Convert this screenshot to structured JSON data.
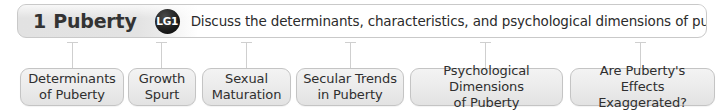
{
  "header": {
    "chapter_number": "1",
    "chapter_title": "Puberty",
    "badge_label": "LG1",
    "learning_goal": "Discuss the determinants, characteristics, and psychological dimensions of puberty",
    "badge_color": "#151515",
    "bar_border_color": "#c9c9c9"
  },
  "nodes": [
    {
      "label": "Determinants\nof Puberty"
    },
    {
      "label": "Growth\nSpurt"
    },
    {
      "label": "Sexual\nMaturation"
    },
    {
      "label": "Secular Trends\nin Puberty"
    },
    {
      "label": "Psychological Dimensions\nof Puberty"
    },
    {
      "label": "Are Puberty's Effects\nExaggerated?"
    }
  ],
  "style": {
    "node_fill_top": "#f3f3f3",
    "node_fill_bottom": "#e2e2e2",
    "node_border_color": "#c4c4c4",
    "connector_color": "#cfcfcf",
    "text_color": "#2f2f2f",
    "background": "#ffffff"
  }
}
